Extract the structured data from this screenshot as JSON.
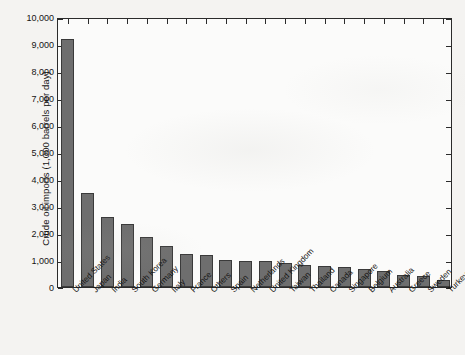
{
  "chart_data": {
    "type": "bar",
    "title": "",
    "xlabel": "",
    "ylabel": "Crude oil imports (1,000 barrels per day)",
    "ylim": [
      0,
      10000
    ],
    "ytick_labels": [
      "10,000",
      "9,000",
      "8,000",
      "7,000",
      "6,000",
      "5,000",
      "4,000",
      "3,000",
      "2,000",
      "1,000",
      "0"
    ],
    "ytick_values": [
      10000,
      9000,
      8000,
      7000,
      6000,
      5000,
      4000,
      3000,
      2000,
      1000,
      0
    ],
    "grid": false,
    "legend": false,
    "bar_color": "#6e6e6e",
    "bar_edge_color": "#3a3a3a",
    "plot_background": "#fbfbfa",
    "axis_color": "#2b2b2b",
    "categories": [
      "United States",
      "Japan",
      "India",
      "South Korea",
      "Germany",
      "Italy",
      "France",
      "Others",
      "Spain",
      "Netherlands",
      "United Kingdom",
      "Taiwan",
      "Thailand",
      "Canada",
      "Singapore",
      "Belgium",
      "Australia",
      "Greece",
      "Sweden",
      "Turkey"
    ],
    "values": [
      9170,
      3470,
      2590,
      2330,
      1840,
      1520,
      1230,
      1190,
      1010,
      970,
      960,
      900,
      810,
      760,
      730,
      680,
      600,
      440,
      410,
      260
    ]
  }
}
